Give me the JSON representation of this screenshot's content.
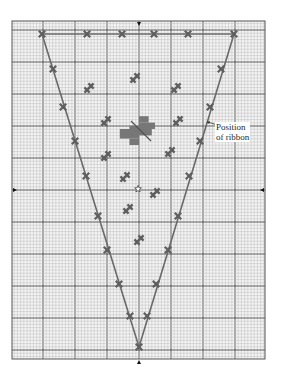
{
  "figure": {
    "type": "cross-stitch chart",
    "grid": {
      "x0": 12,
      "y0": 21,
      "x1": 265,
      "y1": 359,
      "cell": 3.2,
      "major_every": 10,
      "minor_color": "#bdbdbd",
      "major_color": "#3a3a3a",
      "border_color": "#555555"
    },
    "outline": {
      "points": [
        [
          42,
          34
        ],
        [
          234,
          34
        ],
        [
          139,
          347
        ]
      ],
      "color": "#6a6a6a"
    },
    "stitch_color": "#5e5e5e",
    "top_crosses": [
      [
        42,
        34
      ],
      [
        87,
        34
      ],
      [
        122,
        34
      ],
      [
        154,
        34
      ],
      [
        188,
        34
      ],
      [
        234,
        34
      ]
    ],
    "side_crosses": [
      [
        53,
        69
      ],
      [
        63,
        107
      ],
      [
        75,
        141
      ],
      [
        86,
        176
      ],
      [
        98,
        216
      ],
      [
        107,
        250
      ],
      [
        119,
        284
      ],
      [
        130,
        316
      ],
      [
        221,
        69
      ],
      [
        210,
        107
      ],
      [
        200,
        141
      ],
      [
        189,
        176
      ],
      [
        178,
        216
      ],
      [
        168,
        250
      ],
      [
        156,
        284
      ],
      [
        147,
        316
      ],
      [
        139,
        347
      ]
    ],
    "scatter_motifs": [
      [
        89,
        88
      ],
      [
        135,
        78
      ],
      [
        176,
        88
      ],
      [
        106,
        121
      ],
      [
        178,
        121
      ],
      [
        106,
        156
      ],
      [
        170,
        152
      ],
      [
        125,
        177
      ],
      [
        155,
        193
      ],
      [
        128,
        209
      ],
      [
        139,
        240
      ]
    ],
    "center_motif": {
      "x": 139,
      "y": 129,
      "color": "#777777"
    },
    "star": {
      "x": 138,
      "y": 189
    },
    "center_markers": [
      [
        139,
        24,
        "down"
      ],
      [
        139,
        362,
        "up"
      ],
      [
        15,
        190,
        "right"
      ],
      [
        262,
        190,
        "left"
      ]
    ],
    "annotation": {
      "line1": "Position",
      "line2": "of ribbon",
      "leader_from": [
        207,
        122
      ],
      "leader_to": [
        224,
        128
      ]
    }
  }
}
